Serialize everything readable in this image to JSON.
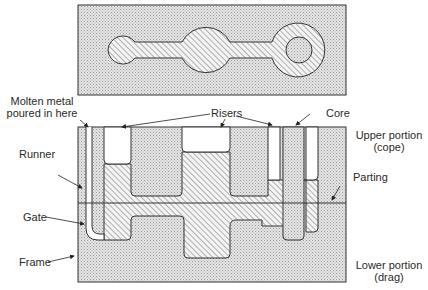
{
  "diagram": {
    "views": [
      "top view of casting cavity",
      "sectional view of mold"
    ],
    "labels": {
      "molten_metal_line1": "Molten metal",
      "molten_metal_line2": "poured in here",
      "risers": "Risers",
      "core": "Core",
      "runner": "Runner",
      "upper_line1": "Upper portion",
      "upper_line2": "(cope)",
      "parting": "Parting",
      "gate": "Gate",
      "frame": "Frame",
      "lower_line1": "Lower portion",
      "lower_line2": "(drag)"
    },
    "colors": {
      "sand": "#d9d9d9",
      "metal_hatch": "#555555",
      "outline": "#333333",
      "background": "#ffffff"
    }
  }
}
